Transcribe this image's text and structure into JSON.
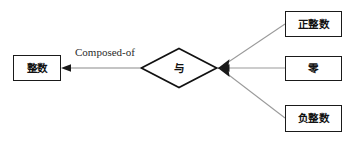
{
  "diagram": {
    "type": "entity-relationship",
    "background_color": "#ffffff",
    "line_color": "#8a8a8a",
    "stroke_color": "#1a1a1a",
    "entities": {
      "integer": {
        "label": "整数"
      },
      "positive_integer": {
        "label": "正整数"
      },
      "zero": {
        "label": "零"
      },
      "negative_integer": {
        "label": "负整数"
      }
    },
    "relationship": {
      "label": "与",
      "shape": "diamond"
    },
    "edges": {
      "composed_of_label": "Composed-of"
    }
  }
}
